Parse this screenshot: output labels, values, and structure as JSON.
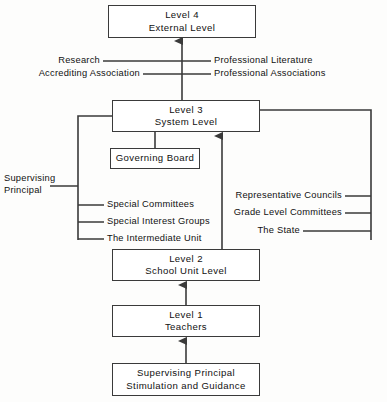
{
  "diagram": {
    "stroke_color": "#3a3a3a",
    "text_color": "#111111",
    "background": "#fdfdfc",
    "nodes": {
      "level4": {
        "line1": "Level 4",
        "line2": "External Level"
      },
      "level3": {
        "line1": "Level 3",
        "line2": "System Level"
      },
      "governing_board": {
        "line1": "Governing Board"
      },
      "level2": {
        "line1": "Level 2",
        "line2": "School Unit Level"
      },
      "level1": {
        "line1": "Level 1",
        "line2": "Teachers"
      },
      "bottom": {
        "line1": "Supervising Principal",
        "line2": "Stimulation and Guidance"
      }
    },
    "upper_left_labels": [
      {
        "text": "Research"
      },
      {
        "text": "Accrediting Association"
      }
    ],
    "upper_right_labels": [
      {
        "text": "Professional Literature"
      },
      {
        "text": "Professional Associations"
      }
    ],
    "left_labels": [
      {
        "text": "Special Committees"
      },
      {
        "text": "Special Interest Groups"
      },
      {
        "text": "The Intermediate Unit"
      }
    ],
    "left_outer_label": {
      "line1": "Supervising",
      "line2": "Principal"
    },
    "right_labels": [
      {
        "text": "Representative Councils"
      },
      {
        "text": "Grade Level Committees"
      },
      {
        "text": "The State"
      }
    ]
  }
}
